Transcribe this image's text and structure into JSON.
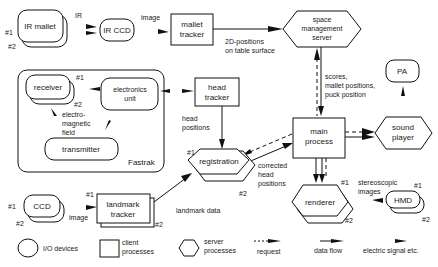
{
  "diagram": {
    "nodes": {
      "ir_mallet": {
        "label": "IR mallet",
        "type": "io-device",
        "instances": [
          "#1",
          "#2"
        ]
      },
      "ir_ccd": {
        "label": "IR CCD",
        "type": "io-device"
      },
      "mallet_tracker": {
        "label_1": "mallet",
        "label_2": "tracker",
        "type": "client-process"
      },
      "space_mgmt": {
        "label_1": "space",
        "label_2": "management",
        "label_3": "server",
        "type": "server-process"
      },
      "receiver": {
        "label": "receiver",
        "type": "io-device",
        "instances": [
          "#1",
          "#2"
        ]
      },
      "electronics_unit": {
        "label_1": "electronics",
        "label_2": "unit",
        "type": "io-device"
      },
      "transmitter": {
        "label": "transmitter",
        "type": "io-device"
      },
      "fastrak": {
        "label": "Fastrak",
        "type": "group"
      },
      "head_tracker": {
        "label_1": "head",
        "label_2": "tracker",
        "type": "client-process"
      },
      "pa": {
        "label": "PA",
        "type": "io-device"
      },
      "main_process": {
        "label_1": "main",
        "label_2": "process",
        "type": "client-process"
      },
      "sound_player": {
        "label_1": "sound",
        "label_2": "player",
        "type": "server-process"
      },
      "registration": {
        "label": "registration",
        "type": "server-process",
        "instances": [
          "#1",
          "#2"
        ]
      },
      "ccd": {
        "label": "CCD",
        "type": "io-device",
        "instances": [
          "#1",
          "#2"
        ]
      },
      "landmark_tracker": {
        "label_1": "landmark",
        "label_2": "tracker",
        "type": "client-process",
        "instances": [
          "#1",
          "#2"
        ]
      },
      "renderer": {
        "label": "renderer",
        "type": "server-process",
        "instances": [
          "#1",
          "#2"
        ]
      },
      "hmd": {
        "label": "HMD",
        "type": "io-device",
        "instances": [
          "#1",
          "#2"
        ]
      }
    },
    "edge_labels": {
      "ir": "IR",
      "image_top": "image",
      "positions_2d_1": "2D-positions",
      "positions_2d_2": "on table surface",
      "scores_1": "scores,",
      "scores_2": "mallet positions,",
      "scores_3": "puck position",
      "em_1": "electro-",
      "em_2": "magnetic",
      "em_3": "field",
      "head_pos_1": "head",
      "head_pos_2": "positions",
      "corrected_1": "corrected",
      "corrected_2": "head",
      "corrected_3": "positions",
      "landmark_data": "landmark data",
      "image_bottom": "image",
      "stereo_1": "stereoscopic",
      "stereo_2": "images"
    },
    "instance_tags": {
      "one": "#1",
      "two": "#2"
    }
  },
  "legend": {
    "io_devices": "I/O devices",
    "client_1": "client",
    "client_2": "processes",
    "server_1": "server",
    "server_2": "processes",
    "request": "request",
    "data_flow": "data flow",
    "electric": "electric signal etc."
  }
}
